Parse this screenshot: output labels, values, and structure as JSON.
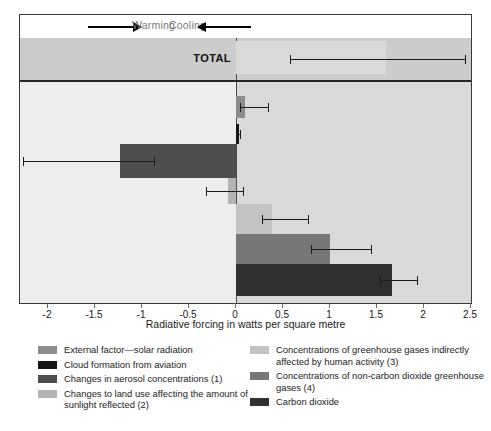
{
  "chart_data": {
    "type": "bar",
    "orientation": "horizontal",
    "title": "",
    "xlabel": "Radiative forcing in watts per square metre",
    "ylabel": "",
    "xlim": [
      -2.35,
      2.5
    ],
    "xticks": [
      -2,
      -1.5,
      -1,
      -0.5,
      0,
      0.5,
      1,
      1.5,
      2,
      2.5
    ],
    "xticklabels": [
      "-2",
      "-1.5",
      "-1",
      "-0.5",
      "0",
      "0.5",
      "1",
      "1.5",
      "2",
      "2.5"
    ],
    "grid": false,
    "legend_position": "below",
    "direction_labels": {
      "left": "Cooling",
      "right": "Warming"
    },
    "total_row_label": "TOTAL",
    "total": {
      "name": "TOTAL",
      "value": 1.6,
      "err_low": 0.57,
      "err_high": 2.45,
      "color": "#d9d9d9"
    },
    "categories": [
      "External factor—solar radiation",
      "Cloud formation from aviation",
      "Changes in aerosol concentrations (1)",
      "Changes to land use affecting the amount of sunlight reflected (2)",
      "Concentrations of greenhouse gases indirectly affected by human activity (3)",
      "Concentrations of non-carbon dioxide greenhouse gases (4)",
      "Carbon dioxide"
    ],
    "values": [
      0.1,
      0.03,
      -1.23,
      -0.09,
      0.38,
      1.0,
      1.66
    ],
    "err_low": [
      0.04,
      0.0,
      -2.27,
      -0.32,
      0.28,
      0.8,
      1.53
    ],
    "err_high": [
      0.35,
      0.05,
      -0.86,
      0.08,
      0.78,
      1.45,
      1.94
    ],
    "colors": [
      "#8c8c8c",
      "#151515",
      "#4e4e4e",
      "#b4b4b4",
      "#c3c3c3",
      "#777777",
      "#303030"
    ],
    "series": [
      {
        "name": "External factor—solar radiation",
        "value": 0.1,
        "err_low": 0.04,
        "err_high": 0.35,
        "color": "#8c8c8c"
      },
      {
        "name": "Cloud formation from aviation",
        "value": 0.03,
        "err_low": 0.0,
        "err_high": 0.05,
        "color": "#151515"
      },
      {
        "name": "Changes in aerosol concentrations (1)",
        "value": -1.23,
        "err_low": -2.27,
        "err_high": -0.86,
        "color": "#4e4e4e"
      },
      {
        "name": "Changes to land use affecting the amount of sunlight reflected (2)",
        "value": -0.09,
        "err_low": -0.32,
        "err_high": 0.08,
        "color": "#b4b4b4"
      },
      {
        "name": "Concentrations of greenhouse gases indirectly affected by human activity (3)",
        "value": 0.38,
        "err_low": 0.28,
        "err_high": 0.78,
        "color": "#c3c3c3"
      },
      {
        "name": "Concentrations of non-carbon dioxide greenhouse gases (4)",
        "value": 1.0,
        "err_low": 0.8,
        "err_high": 1.45,
        "color": "#777777"
      },
      {
        "name": "Carbon dioxide",
        "value": 1.66,
        "err_low": 1.53,
        "err_high": 1.94,
        "color": "#303030"
      }
    ]
  },
  "legend": {
    "left_column": [
      {
        "label": "External factor—solar radiation",
        "color": "#8c8c8c"
      },
      {
        "label": "Cloud formation from aviation",
        "color": "#151515"
      },
      {
        "label": "Changes in aerosol concentrations (1)",
        "color": "#4e4e4e"
      },
      {
        "label": "Changes to land use affecting the amount of sunlight reflected (2)",
        "color": "#b4b4b4"
      }
    ],
    "right_column": [
      {
        "label": "Concentrations of greenhouse gases indirectly affected by human activity (3)",
        "color": "#c3c3c3"
      },
      {
        "label": "Concentrations of non-carbon dioxide greenhouse gases (4)",
        "color": "#777777"
      },
      {
        "label": "Carbon dioxide",
        "color": "#303030"
      }
    ]
  }
}
